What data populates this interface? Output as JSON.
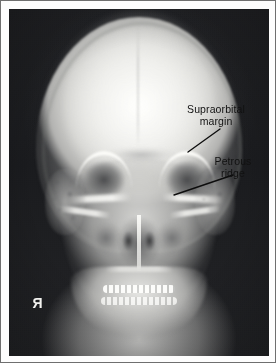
{
  "figure": {
    "modality": "radiograph",
    "view": "PA skull",
    "frame_color": "#6f6f6f",
    "mat_color": "#fdfdfd",
    "film_background_color": "#1a1b1e",
    "bone_color": "#f4f4f2"
  },
  "markers": {
    "side_marker": {
      "label": "Я",
      "meaning": "right-side-marker-mirrored",
      "color": "#f2f2ef"
    }
  },
  "annotations": [
    {
      "id": "supraorbital-margin",
      "line1": "Supraorbital",
      "line2": "margin",
      "text": "Supraorbital\nmargin",
      "color": "#111111",
      "leader": {
        "x1": 211,
        "y1": 120,
        "x2": 179,
        "y2": 143
      }
    },
    {
      "id": "petrous-ridge",
      "line1": "Petrous",
      "line2": "ridge",
      "text": "Petrous\nridge",
      "color": "#111111",
      "leader": {
        "x1": 224,
        "y1": 166,
        "x2": 165,
        "y2": 186
      }
    }
  ],
  "anatomy": {
    "structures": [
      "cranial vault",
      "orbits",
      "supraorbital margins",
      "petrous ridges",
      "mastoid air cells",
      "frontal sinus",
      "nasal cavity",
      "nasal septum",
      "maxillary sinuses",
      "zygomatic arches",
      "hard palate",
      "teeth",
      "mandible",
      "cervical soft tissue"
    ]
  }
}
